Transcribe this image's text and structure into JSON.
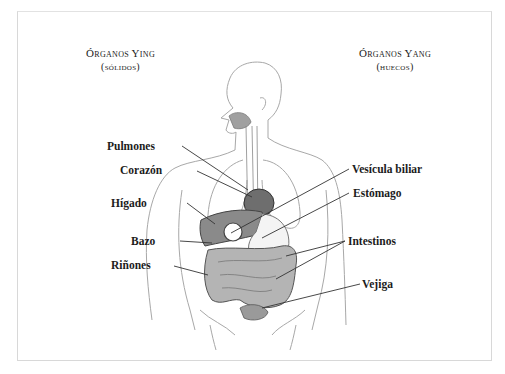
{
  "diagram": {
    "headings": {
      "yin": {
        "title": "Órganos Ying",
        "subtitle": "(sólidos)"
      },
      "yang": {
        "title": "Órganos Yang",
        "subtitle": "(huecos)"
      }
    },
    "labels_left": [
      {
        "id": "pulmones",
        "text": "Pulmones"
      },
      {
        "id": "corazon",
        "text": "Corazón"
      },
      {
        "id": "higado",
        "text": "Hígado"
      },
      {
        "id": "bazo",
        "text": "Bazo"
      },
      {
        "id": "rinones",
        "text": "Riñones"
      }
    ],
    "labels_right": [
      {
        "id": "vesicula",
        "text": "Vesícula biliar"
      },
      {
        "id": "estomago",
        "text": "Estómago"
      },
      {
        "id": "intestinos",
        "text": "Intestinos"
      },
      {
        "id": "vejiga",
        "text": "Vejiga"
      }
    ],
    "colors": {
      "organ_fill": "#8a8a8a",
      "organ_dark": "#555555",
      "outline": "#9a9a9a",
      "leader_line": "#333333",
      "frame": "#d8d8d8"
    }
  }
}
